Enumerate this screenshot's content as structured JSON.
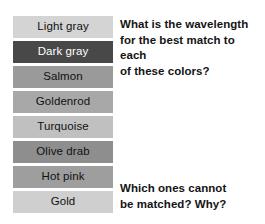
{
  "page": {
    "background_color": "#ffffff",
    "text_color": "#141414"
  },
  "swatches": [
    {
      "label": "Light gray",
      "color": "#d4d4d4",
      "label_color": "#111111"
    },
    {
      "label": "Dark gray",
      "color": "#484848",
      "label_color": "#ffffff"
    },
    {
      "label": "Salmon",
      "color": "#9a9a9a",
      "label_color": "#111111"
    },
    {
      "label": "Goldenrod",
      "color": "#a8a8a8",
      "label_color": "#111111"
    },
    {
      "label": "Turquoise",
      "color": "#c0c0c0",
      "label_color": "#111111"
    },
    {
      "label": "Olive drab",
      "color": "#8e8e8e",
      "label_color": "#111111"
    },
    {
      "label": "Hot pink",
      "color": "#9e9e9e",
      "label_color": "#111111"
    },
    {
      "label": "Gold",
      "color": "#cfcfcf",
      "label_color": "#111111"
    }
  ],
  "questions": {
    "top": "What is the wavelength\nfor the best match to each\nof these colors?",
    "bottom": "Which ones cannot\nbe matched?  Why?"
  }
}
